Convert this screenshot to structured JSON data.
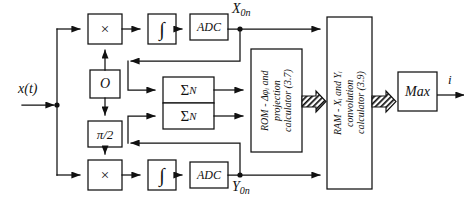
{
  "diagram": {
    "line_color": "#111111",
    "fill_color": "#ffffff",
    "background": "#ffffff"
  },
  "signals": {
    "input": "x(t)",
    "x_branch": "X",
    "x_branch_sub": "0n",
    "y_branch": "Y",
    "y_branch_sub": "0n",
    "output": "i"
  },
  "blocks": {
    "mixer_top": "×",
    "mixer_bottom": "×",
    "integrator_top": "∫",
    "integrator_bottom": "∫",
    "adc_top": "ADC",
    "adc_bottom": "ADC",
    "oscillator": "O",
    "phase_shifter": "π/2",
    "accumulator_top": "Σ",
    "accumulator_top_sub": "N",
    "accumulator_bottom": "Σ",
    "accumulator_bottom_sub": "N",
    "rom": "ROM - Δφᵢ and\nprojection\ncalculator (3.7)",
    "ram": "RAM - Xᵢ and Yᵢ\nconvolution\ncalculator (3.9)",
    "max": "Max"
  }
}
